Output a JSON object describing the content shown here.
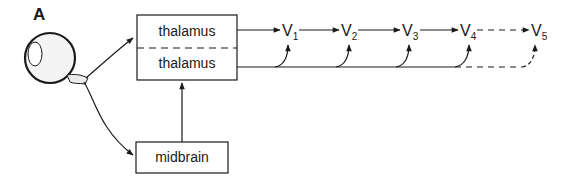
{
  "figure": {
    "panel_label": "A",
    "colors": {
      "stroke": "#1a1a1a",
      "background": "#ffffff",
      "eye_fill": "#f4f4f4"
    }
  },
  "nodes": {
    "eye": {
      "label": "eye"
    },
    "thalamus_top": {
      "label": "thalamus"
    },
    "thalamus_bottom": {
      "label": "thalamus"
    },
    "midbrain": {
      "label": "midbrain"
    }
  },
  "visual_areas": [
    {
      "main": "V",
      "sub": "1"
    },
    {
      "main": "V",
      "sub": "2"
    },
    {
      "main": "V",
      "sub": "3"
    },
    {
      "main": "V",
      "sub": "4"
    },
    {
      "main": "V",
      "sub": "5"
    }
  ],
  "connections": [
    {
      "from": "eye",
      "to": "thalamus",
      "style": "solid"
    },
    {
      "from": "eye",
      "to": "midbrain",
      "style": "solid"
    },
    {
      "from": "midbrain",
      "to": "thalamus",
      "style": "solid"
    },
    {
      "from": "thalamus_top",
      "to": "V1",
      "style": "solid"
    },
    {
      "from": "V1",
      "to": "V2",
      "style": "solid"
    },
    {
      "from": "V2",
      "to": "V3",
      "style": "solid"
    },
    {
      "from": "V3",
      "to": "V4",
      "style": "solid"
    },
    {
      "from": "V4",
      "to": "V5",
      "style": "dashed"
    },
    {
      "from": "thalamus_bottom",
      "to": "V1",
      "style": "solid"
    },
    {
      "from": "thalamus_bottom",
      "to": "V2",
      "style": "solid"
    },
    {
      "from": "thalamus_bottom",
      "to": "V3",
      "style": "solid"
    },
    {
      "from": "thalamus_bottom",
      "to": "V4",
      "style": "solid"
    },
    {
      "from": "thalamus_bottom",
      "to": "V5",
      "style": "dashed"
    }
  ]
}
